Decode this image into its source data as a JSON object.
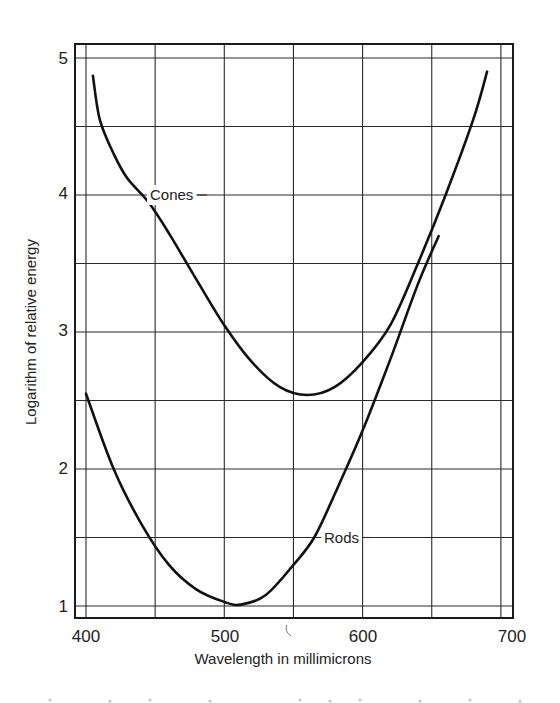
{
  "chart_data": {
    "type": "line",
    "title": "",
    "xlabel": "Wavelength in millimicrons",
    "ylabel": "Logarithm of relative energy",
    "xlim": [
      395,
      708
    ],
    "ylim": [
      0.92,
      5.1
    ],
    "x_ticks": [
      400,
      500,
      600,
      700
    ],
    "x_tick_labels": [
      "400",
      "500",
      "600",
      "700"
    ],
    "y_ticks": [
      1,
      2,
      3,
      4,
      5
    ],
    "y_tick_labels": [
      "1",
      "2",
      "3",
      "4",
      "5"
    ],
    "grid": true,
    "grid_x": [
      400,
      450,
      500,
      550,
      600,
      650,
      700
    ],
    "grid_y": [
      1,
      1.5,
      2,
      2.5,
      3,
      3.5,
      4,
      4.5,
      5
    ],
    "legend": "none (inline curve labels)",
    "series": [
      {
        "name": "Cones",
        "x": [
          405,
          410,
          420,
          430,
          445,
          460,
          480,
          500,
          520,
          540,
          560,
          580,
          600,
          620,
          640,
          660,
          680,
          690
        ],
        "values": [
          4.87,
          4.55,
          4.3,
          4.12,
          3.95,
          3.72,
          3.38,
          3.05,
          2.78,
          2.6,
          2.54,
          2.6,
          2.78,
          3.05,
          3.5,
          4.0,
          4.55,
          4.9
        ],
        "label": {
          "text": "Cones",
          "x": 435,
          "y": 4.0
        }
      },
      {
        "name": "Rods",
        "x": [
          400,
          420,
          440,
          460,
          480,
          500,
          512,
          530,
          550,
          565,
          580,
          600,
          620,
          640,
          655
        ],
        "values": [
          2.55,
          2.0,
          1.6,
          1.3,
          1.12,
          1.03,
          1.01,
          1.08,
          1.3,
          1.5,
          1.82,
          2.28,
          2.8,
          3.35,
          3.7
        ],
        "label": {
          "text": "Rods",
          "x": 575,
          "y": 1.5
        }
      }
    ]
  },
  "labels": {
    "cones": "Cones",
    "rods": "Rods",
    "xlabel": "Wavelength in millimicrons",
    "ylabel": "Logarithm of relative energy"
  },
  "ticks": {
    "x": [
      "400",
      "500",
      "600",
      "700"
    ],
    "y": [
      "1",
      "2",
      "3",
      "4",
      "5"
    ]
  }
}
